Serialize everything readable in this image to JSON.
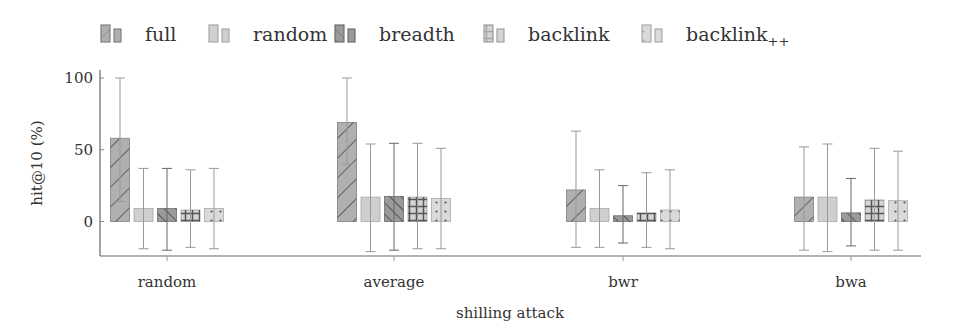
{
  "chart_data": {
    "type": "bar",
    "title": "",
    "xlabel": "shilling attack",
    "ylabel": "hit@10 (%)",
    "ylim": [
      -24,
      100
    ],
    "yticks": [
      0,
      50,
      100
    ],
    "grid": false,
    "legend_position": "top",
    "error_bars": true,
    "categories": [
      "random",
      "average",
      "bwr",
      "bwa"
    ],
    "series": [
      {
        "name": "full",
        "name_sub": "",
        "fill": "#b0b0b0",
        "pattern": "diag-down",
        "stroke": "#808080",
        "values": [
          58,
          69,
          22,
          17
        ],
        "err_high": [
          100,
          100,
          63,
          52
        ],
        "err_low": [
          14,
          40,
          -18,
          -20
        ]
      },
      {
        "name": "random",
        "name_sub": "",
        "fill": "#cfcfcf",
        "pattern": "none",
        "stroke": "#a8a8a8",
        "values": [
          9,
          17,
          9,
          17
        ],
        "err_high": [
          37,
          54,
          36,
          54
        ],
        "err_low": [
          -19,
          -21,
          -18,
          -21
        ]
      },
      {
        "name": "breadth",
        "name_sub": "",
        "fill": "#9a9a9a",
        "pattern": "diag-up",
        "stroke": "#6e6e6e",
        "values": [
          9,
          17.5,
          4,
          6
        ],
        "err_high": [
          37,
          54.5,
          25,
          30
        ],
        "err_low": [
          -20,
          -20,
          -15,
          -17
        ]
      },
      {
        "name": "backlink",
        "name_sub": "",
        "fill": "#d4d4d4",
        "pattern": "grid",
        "stroke": "#a0a0a0",
        "values": [
          8,
          17,
          6,
          15
        ],
        "err_high": [
          36,
          54.5,
          34,
          51
        ],
        "err_low": [
          -18,
          -19,
          -18,
          -20
        ]
      },
      {
        "name": "backlink",
        "name_sub": "++",
        "fill": "#dadada",
        "pattern": "dots",
        "stroke": "#a8a8a8",
        "values": [
          9,
          16,
          8,
          14.5
        ],
        "err_high": [
          37,
          51,
          36,
          49
        ],
        "err_low": [
          -19,
          -19,
          -19,
          -20
        ]
      }
    ]
  }
}
